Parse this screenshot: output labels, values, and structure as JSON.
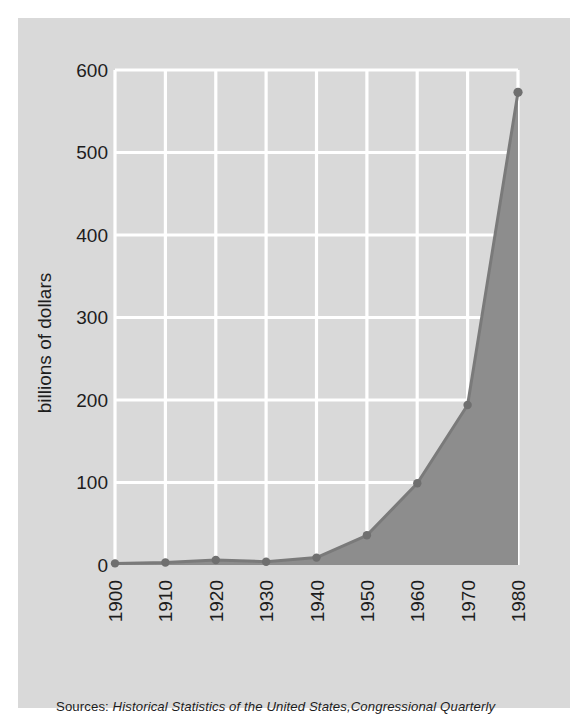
{
  "chart_data": {
    "type": "area",
    "title": "",
    "subtitle": "",
    "xlabel": "",
    "ylabel": "billions of dollars",
    "categories": [
      "1900",
      "1910",
      "1920",
      "1930",
      "1940",
      "1950",
      "1960",
      "1970",
      "1980"
    ],
    "x": [
      1900,
      1910,
      1920,
      1930,
      1940,
      1950,
      1960,
      1970,
      1980
    ],
    "values": [
      2,
      3,
      6,
      4,
      9,
      36,
      99,
      194,
      573
    ],
    "series": [
      {
        "name": "federal spending",
        "values": [
          2,
          3,
          6,
          4,
          9,
          36,
          99,
          194,
          573
        ]
      }
    ],
    "xlim": [
      1900,
      1980
    ],
    "ylim": [
      0,
      600
    ],
    "yticks": [
      0,
      100,
      200,
      300,
      400,
      500,
      600
    ],
    "ytick_labels": [
      "0",
      "100",
      "200",
      "300",
      "400",
      "500",
      "600"
    ],
    "xticks": [
      1900,
      1910,
      1920,
      1930,
      1940,
      1950,
      1960,
      1970,
      1980
    ],
    "xtick_labels": [
      "1900",
      "1910",
      "1920",
      "1930",
      "1940",
      "1950",
      "1960",
      "1970",
      "1980"
    ],
    "xtick_rotation": 90,
    "grid": true,
    "gridline_color": "#ffffff",
    "legend": false,
    "legend_position": "none",
    "area_fill_color": "#8d8d8d",
    "line_color": "#7a7a7a",
    "marker_color": "#7a7a7a",
    "panel_background": "#d9d9d9",
    "page_background": "#ffffff",
    "text_color": "#1d1d1d",
    "annotations": []
  },
  "source": {
    "prefix": "Sources:",
    "title_one": "Historical Statistics of the United States",
    "separator": ",",
    "title_two": "Congressional Quarterly"
  }
}
